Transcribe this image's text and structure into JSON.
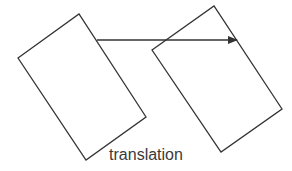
{
  "diagram": {
    "caption": "translation",
    "stroke_color": "#333333",
    "shapes": [
      {
        "name": "original-rectangle",
        "points": [
          [
            18,
            58
          ],
          [
            79,
            14
          ],
          [
            146,
            117
          ],
          [
            86,
            160
          ]
        ]
      },
      {
        "name": "translated-rectangle",
        "points": [
          [
            152,
            50
          ],
          [
            214,
            6
          ],
          [
            282,
            109
          ],
          [
            221,
            152
          ]
        ]
      }
    ],
    "arrow": {
      "from": [
        97,
        40
      ],
      "to": [
        237,
        40
      ]
    }
  }
}
